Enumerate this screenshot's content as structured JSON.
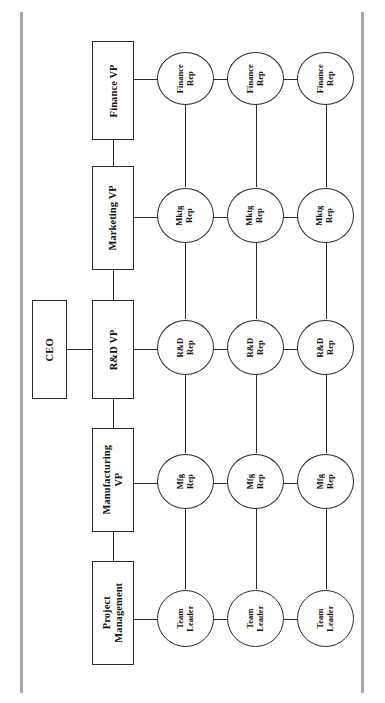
{
  "diagram": {
    "type": "matrix-organization-chart",
    "orientation": "rotated-90-ccw",
    "executive": {
      "label": "CEO"
    },
    "functions": [
      {
        "id": "finance",
        "label": "Finance VP"
      },
      {
        "id": "marketing",
        "label": "Marketing VP"
      },
      {
        "id": "rnd",
        "label": "R&D VP"
      },
      {
        "id": "manufacturing",
        "label": "Manufacturing\nVP"
      },
      {
        "id": "project",
        "label": "Project\nManagement"
      }
    ],
    "rep_rows": [
      {
        "id": "finance-reps",
        "label": "Finance\nRep",
        "count": 3
      },
      {
        "id": "mktg-reps",
        "label": "Mktg\nRep",
        "count": 3
      },
      {
        "id": "rnd-reps",
        "label": "R&D\nRep",
        "count": 3
      },
      {
        "id": "mfg-reps",
        "label": "Mfg\nRep",
        "count": 3
      },
      {
        "id": "team-leaders",
        "label": "Team\nLeader",
        "count": 3
      }
    ],
    "reps": {
      "finance": [
        "Finance\nRep",
        "Finance\nRep",
        "Finance\nRep"
      ],
      "mktg": [
        "Mktg\nRep",
        "Mktg\nRep",
        "Mktg\nRep"
      ],
      "rnd": [
        "R&D\nRep",
        "R&D\nRep",
        "R&D\nRep"
      ],
      "mfg": [
        "Mfg\nRep",
        "Mfg\nRep",
        "Mfg\nRep"
      ],
      "team": [
        "Team\nLeader",
        "Team\nLeader",
        "Team\nLeader"
      ]
    },
    "colors": {
      "stroke": "#2b2b2b",
      "edge_rule": "#a8a8a8",
      "background": "#ffffff",
      "text": "#111111"
    }
  }
}
